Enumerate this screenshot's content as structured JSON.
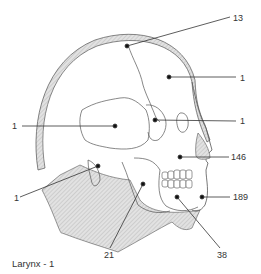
{
  "figure": {
    "caption": "Larynx - 1",
    "labels": [
      {
        "id": "parietal-suture",
        "text": "13",
        "x": 233,
        "y": 13
      },
      {
        "id": "frontal",
        "text": "1",
        "x": 240,
        "y": 74
      },
      {
        "id": "temporal",
        "text": "1",
        "x": 12,
        "y": 121
      },
      {
        "id": "sphenoid-orbit",
        "text": "1",
        "x": 240,
        "y": 117
      },
      {
        "id": "maxilla",
        "text": "146",
        "x": 231,
        "y": 154
      },
      {
        "id": "mastoid",
        "text": "1",
        "x": 14,
        "y": 193
      },
      {
        "id": "chin",
        "text": "189",
        "x": 233,
        "y": 194
      },
      {
        "id": "ramus",
        "text": "21",
        "x": 104,
        "y": 252
      },
      {
        "id": "mandible",
        "text": "38",
        "x": 217,
        "y": 252
      }
    ],
    "colors": {
      "line": "#333333",
      "hatch": "#cfcfcf",
      "bg": "#ffffff"
    }
  }
}
